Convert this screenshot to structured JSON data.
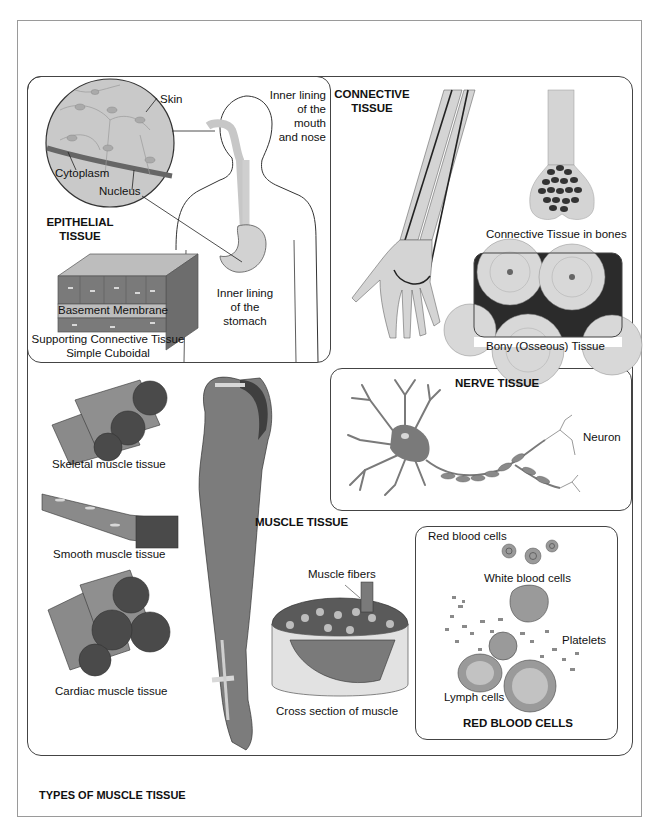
{
  "figure": {
    "caption": "TYPES OF MUSCLE TISSUE"
  },
  "epithelial": {
    "title_line1": "EPITHELIAL",
    "title_line2": "TISSUE",
    "labels": {
      "skin": "Skin",
      "cytoplasm": "Cytoplasm",
      "nucleus": "Nucleus",
      "mouth_line1": "Inner lining",
      "mouth_line2": "of the",
      "mouth_line3": "mouth",
      "mouth_line4": "and nose",
      "stomach_line1": "Inner lining",
      "stomach_line2": "of the",
      "stomach_line3": "stomach",
      "basement": "Basement Membrane",
      "supporting": "Supporting Connective Tissue",
      "cuboidal": "Simple Cuboidal"
    }
  },
  "connective": {
    "title_line1": "CONNECTIVE",
    "title_line2": "TISSUE",
    "labels": {
      "bones": "Connective Tissue in bones",
      "bony": "Bony (Osseous) Tissue"
    }
  },
  "muscle": {
    "title": "MUSCLE TISSUE",
    "labels": {
      "skeletal": "Skeletal muscle tissue",
      "smooth": "Smooth  muscle tissue",
      "cardiac": "Cardiac muscle tissue",
      "fibers": "Muscle fibers",
      "cross_section": "Cross section of muscle"
    }
  },
  "nerve": {
    "title": "NERVE TISSUE",
    "labels": {
      "neuron": "Neuron"
    }
  },
  "blood": {
    "title": "RED BLOOD CELLS",
    "labels": {
      "red": "Red blood cells",
      "white": "White blood cells",
      "platelets": "Platelets",
      "lymph": "Lymph cells"
    }
  },
  "colors": {
    "tissue_light": "#d4d4d4",
    "tissue_mid": "#8c8c8c",
    "tissue_dark": "#4a4a4a",
    "line": "#333333",
    "frame": "#9a9a9a"
  }
}
